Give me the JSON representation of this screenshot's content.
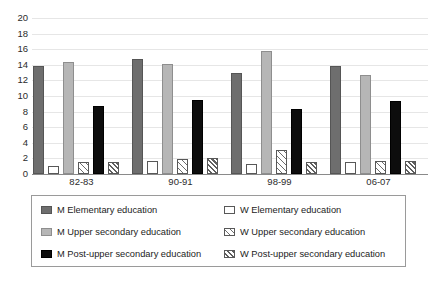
{
  "chart_data": {
    "type": "bar",
    "title": "",
    "subtitle": "",
    "xlabel": "",
    "ylabel": "",
    "ylim": [
      0,
      20
    ],
    "ytick_step": 2,
    "yticks": [
      20,
      18,
      16,
      14,
      12,
      10,
      8,
      6,
      4,
      2,
      0
    ],
    "grid": true,
    "grid_orientation": "horizontal",
    "legend_position": "bottom",
    "legend_columns": 2,
    "categories": [
      "82-83",
      "90-91",
      "98-99",
      "06-07"
    ],
    "series": [
      {
        "name": "M Elementary education",
        "key": "m-elementary",
        "fill": "#6e6e6e",
        "pattern": "solid",
        "values": [
          13.8,
          14.7,
          13.0,
          13.8
        ]
      },
      {
        "name": "W Elementary education",
        "key": "w-elementary",
        "fill": "#ffffff",
        "pattern": "empty",
        "values": [
          1.0,
          1.7,
          1.3,
          1.6
        ]
      },
      {
        "name": "M Upper secondary education",
        "key": "m-upper",
        "fill": "#b6b6b6",
        "pattern": "solid",
        "values": [
          14.3,
          14.1,
          15.8,
          12.7
        ]
      },
      {
        "name": "W Upper secondary education",
        "key": "w-upper",
        "fill": "#ffffff",
        "pattern": "hatch-wide",
        "values": [
          1.5,
          1.9,
          3.1,
          1.7
        ]
      },
      {
        "name": "M Post-upper secondary education",
        "key": "m-post-upper",
        "fill": "#0d0d0d",
        "pattern": "solid",
        "values": [
          8.7,
          9.5,
          8.3,
          9.3
        ]
      },
      {
        "name": "W Post-upper secondary education",
        "key": "w-post-upper",
        "fill": "#ffffff",
        "pattern": "hatch-dense",
        "values": [
          1.5,
          2.0,
          1.6,
          1.7
        ]
      }
    ]
  },
  "legend": {
    "items": [
      {
        "label": "M Elementary education",
        "series_key": "m-elementary"
      },
      {
        "label": "M Upper secondary education",
        "series_key": "m-upper"
      },
      {
        "label": "M Post-upper secondary education",
        "series_key": "m-post-upper"
      },
      {
        "label": "W Elementary education",
        "series_key": "w-elementary"
      },
      {
        "label": "W Upper secondary education",
        "series_key": "w-upper"
      },
      {
        "label": "W Post-upper secondary education",
        "series_key": "w-post-upper"
      }
    ]
  },
  "colors": {
    "m_elementary": "#6e6e6e",
    "m_upper_secondary": "#b6b6b6",
    "m_post_upper_secondary": "#0d0d0d",
    "w_fill": "#ffffff",
    "outline": "#585858",
    "gridline": "#e6e6e6",
    "axis": "#8a8a8a",
    "text": "#1c1c1c"
  }
}
